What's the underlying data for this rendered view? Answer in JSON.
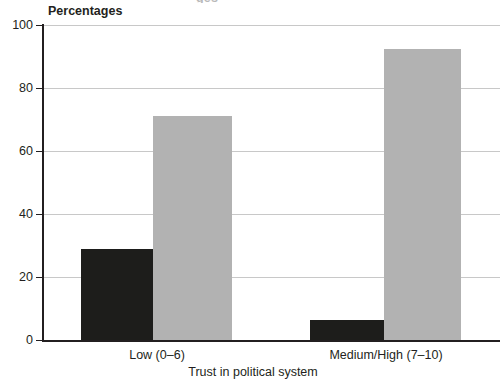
{
  "chart_data": {
    "type": "bar",
    "title": "",
    "title_remnant": "ges",
    "ylabel": "Percentages",
    "xlabel": "Trust in political system",
    "categories": [
      "Low (0–6)",
      "Medium/High (7–10)"
    ],
    "series": [
      {
        "name": "dark",
        "color": "#1d1d1b",
        "values": [
          29,
          6.5
        ]
      },
      {
        "name": "light",
        "color": "#b2b2b2",
        "values": [
          71,
          92.5
        ]
      }
    ],
    "ylim": [
      0,
      100
    ],
    "yticks": [
      0,
      20,
      40,
      60,
      80,
      100
    ],
    "ytick_labels": [
      "0",
      "20",
      "40",
      "60",
      "80",
      "100"
    ],
    "grid": true,
    "legend": "none",
    "gridline_color": "#c8c8c8",
    "axis_color": "#231f20"
  },
  "ticks": {
    "t0": "0",
    "t20": "20",
    "t40": "40",
    "t60": "60",
    "t80": "80",
    "t100": "100"
  },
  "categories": {
    "c0": "Low (0–6)",
    "c1": "Medium/High (7–10)"
  },
  "labels": {
    "y_caption": "Percentages",
    "x_title": "Trust in political system",
    "title_remnant": "ges"
  }
}
